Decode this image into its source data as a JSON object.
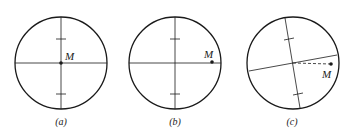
{
  "panels": [
    {
      "id": "a",
      "caption": "(a)",
      "point_label": "M",
      "description": "Point M at the crosshair center"
    },
    {
      "id": "b",
      "caption": "(b)",
      "point_label": "M",
      "description": "Point M on the horizontal line near the right edge"
    },
    {
      "id": "c",
      "caption": "(c)",
      "point_label": "M",
      "description": "Crosshair rotated; M off the tilted line, connected by dashed line"
    }
  ],
  "colors": {
    "stroke": "#1a1a1a",
    "background": "#ffffff"
  }
}
